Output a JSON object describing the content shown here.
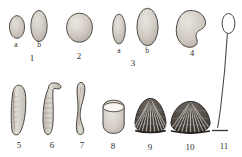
{
  "plate": {
    "kind": "scientific-illustration-plate",
    "background_color": "#ffffff",
    "ink_color": "#3a3734",
    "fill_color": "#cfcac4",
    "width": 242,
    "height": 157,
    "figure_count": 11
  },
  "figures": [
    {
      "id": "fig-1",
      "number": "1",
      "number_pos": [
        31,
        59
      ],
      "shape": "ovoid-pair",
      "subfigures": [
        {
          "letter": "a",
          "letter_pos": [
            16,
            45
          ],
          "shape": "short-ovoid",
          "x": 8,
          "y": 14,
          "w": 17,
          "h": 24
        },
        {
          "letter": "b",
          "letter_pos": [
            39,
            45
          ],
          "shape": "tall-ovoid",
          "x": 30,
          "y": 10,
          "w": 18,
          "h": 31
        }
      ]
    },
    {
      "id": "fig-2",
      "number": "2",
      "number_pos": [
        79,
        57
      ],
      "shape": "rounded-ovoid",
      "x": 66,
      "y": 13,
      "w": 26,
      "h": 29
    },
    {
      "id": "fig-3",
      "number": "3",
      "number_pos": [
        133,
        63
      ],
      "shape": "ovoid-pair",
      "subfigures": [
        {
          "letter": "a",
          "letter_pos": [
            119,
            51
          ],
          "shape": "narrow-ovoid",
          "x": 112,
          "y": 14,
          "w": 14,
          "h": 30
        },
        {
          "letter": "b",
          "letter_pos": [
            147,
            51
          ],
          "shape": "large-ovoid",
          "x": 136,
          "y": 8,
          "w": 23,
          "h": 38
        }
      ]
    },
    {
      "id": "fig-4",
      "number": "4",
      "number_pos": [
        192,
        54
      ],
      "shape": "reniform-bean",
      "x": 176,
      "y": 10,
      "w": 31,
      "h": 36
    },
    {
      "id": "fig-5",
      "number": "5",
      "number_pos": [
        19,
        146
      ],
      "shape": "elongate-curved-capsule",
      "x": 10,
      "y": 85,
      "w": 18,
      "h": 50
    },
    {
      "id": "fig-6",
      "number": "6",
      "number_pos": [
        52,
        146
      ],
      "shape": "hooked-club-capsule",
      "x": 41,
      "y": 82,
      "w": 22,
      "h": 53
    },
    {
      "id": "fig-7",
      "number": "7",
      "number_pos": [
        82,
        146
      ],
      "shape": "slender-sigmoid-capsule",
      "x": 73,
      "y": 82,
      "w": 18,
      "h": 53
    },
    {
      "id": "fig-8",
      "number": "8",
      "number_pos": [
        113,
        147
      ],
      "shape": "open-barrel-cup",
      "x": 101,
      "y": 100,
      "w": 25,
      "h": 33
    },
    {
      "id": "fig-9",
      "number": "9",
      "number_pos": [
        150,
        148
      ],
      "shape": "ribbed-conical-shell",
      "x": 132,
      "y": 98,
      "w": 37,
      "h": 38
    },
    {
      "id": "fig-10",
      "number": "10",
      "number_pos": [
        190,
        148
      ],
      "shape": "ribbed-domed-shell",
      "x": 170,
      "y": 101,
      "w": 41,
      "h": 35
    },
    {
      "id": "fig-11",
      "number": "11",
      "number_pos": [
        224,
        147
      ],
      "shape": "stalked-capsule-with-baseline",
      "x": 213,
      "y": 14,
      "w": 24,
      "h": 123
    }
  ]
}
